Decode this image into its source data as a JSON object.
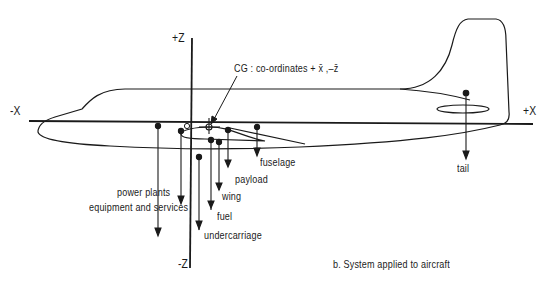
{
  "axes": {
    "plus_z": "+Z",
    "minus_z": "-Z",
    "plus_x": "+X",
    "minus_x": "-X"
  },
  "cg_label": "CG :  co-ordinates + x̄ ,–z̄",
  "origin_label": "O",
  "components": [
    {
      "id": "power-plants",
      "label": "power plants"
    },
    {
      "id": "equipment-and-services",
      "label": "equipment and services"
    },
    {
      "id": "undercarriage",
      "label": "undercarriage"
    },
    {
      "id": "fuel",
      "label": "fuel"
    },
    {
      "id": "wing",
      "label": "wing"
    },
    {
      "id": "payload",
      "label": "payload"
    },
    {
      "id": "fuselage",
      "label": "fuselage"
    },
    {
      "id": "tail",
      "label": "tail"
    }
  ],
  "caption": "b.  System applied to aircraft",
  "colors": {
    "ink": "#1a1a1a",
    "background": "#ffffff"
  }
}
